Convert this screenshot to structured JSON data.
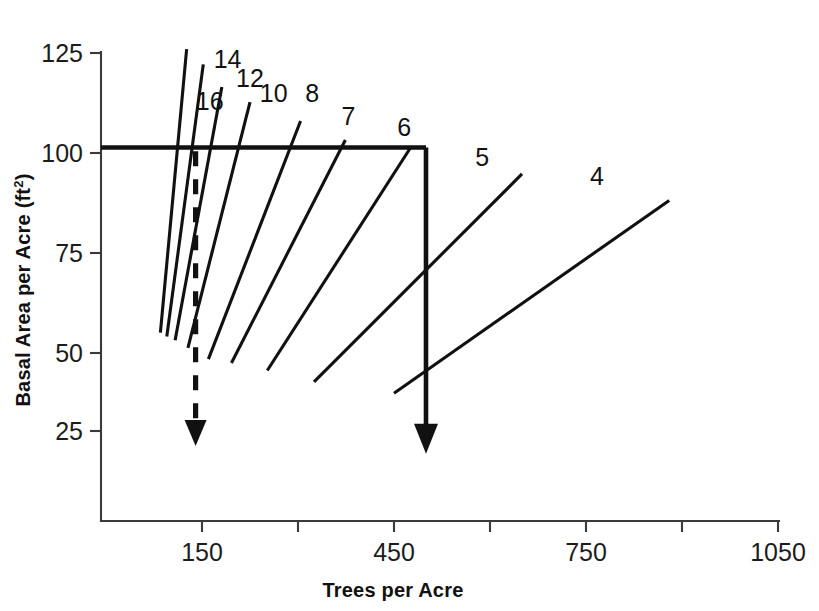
{
  "chart_data": {
    "type": "line",
    "title": "",
    "xlabel": "Trees per Acre",
    "ylabel": "Basal Area per Acre (ft",
    "ylabel_superscript": "2",
    "ylabel_suffix": ")",
    "xlim": [
      0,
      1150
    ],
    "ylim": [
      10,
      130
    ],
    "grid": false,
    "legend_position": "inline-end-labels",
    "x_ticks": [
      150,
      450,
      750,
      1050
    ],
    "x_ticks_all": [
      150,
      300,
      450,
      600,
      750,
      900,
      1050
    ],
    "x_tick_labels": [
      "150",
      "450",
      "750",
      "1050"
    ],
    "y_ticks": [
      25,
      50,
      75,
      100,
      125
    ],
    "y_tick_labels": [
      "25",
      "50",
      "75",
      "100",
      "125"
    ],
    "series": [
      {
        "name": "16",
        "label": "16",
        "label_x": 162,
        "label_y": 110,
        "points": [
          [
            126,
            126
          ],
          [
            85,
            51
          ]
        ]
      },
      {
        "name": "14",
        "label": "14",
        "label_x": 190,
        "label_y": 121,
        "points": [
          [
            152,
            122
          ],
          [
            95,
            50
          ]
        ]
      },
      {
        "name": "12",
        "label": "12",
        "label_x": 225,
        "label_y": 116,
        "points": [
          [
            181,
            116
          ],
          [
            108,
            49
          ]
        ]
      },
      {
        "name": "10",
        "label": "10",
        "label_x": 262,
        "label_y": 112,
        "points": [
          [
            225,
            112
          ],
          [
            128,
            47
          ]
        ]
      },
      {
        "name": "8",
        "label": "8",
        "label_x": 322,
        "label_y": 112,
        "points": [
          [
            304,
            107
          ],
          [
            160,
            44
          ]
        ]
      },
      {
        "name": "7",
        "label": "7",
        "label_x": 379,
        "label_y": 106,
        "points": [
          [
            374,
            102
          ],
          [
            196,
            43
          ]
        ]
      },
      {
        "name": "6",
        "label": "6",
        "label_x": 466,
        "label_y": 103,
        "points": [
          [
            476,
            100
          ],
          [
            252,
            41
          ]
        ]
      },
      {
        "name": "5",
        "label": "5",
        "label_x": 588,
        "label_y": 95,
        "points": [
          [
            650,
            93
          ],
          [
            325,
            38
          ]
        ]
      },
      {
        "name": "4",
        "label": "4",
        "label_x": 767,
        "label_y": 90,
        "points": [
          [
            880,
            86
          ],
          [
            450,
            35
          ]
        ]
      }
    ],
    "reference_line": {
      "name": "basal-area-100-reference",
      "y_value": 100,
      "x_start": 0,
      "x_end": 500,
      "style": "solid-thick"
    },
    "annotations": [
      {
        "name": "solid-arrow",
        "style": "solid",
        "x": 500,
        "y_start": 100,
        "y_end": 19,
        "direction": "down"
      },
      {
        "name": "dashed-arrow",
        "style": "dashed",
        "x": 140,
        "y_start": 99,
        "y_end": 21,
        "direction": "down"
      }
    ]
  },
  "axes": {
    "x_title": "Trees per Acre",
    "y_title_main": "Basal Area per Acre (ft",
    "y_title_sup": "2",
    "y_title_end": ")"
  }
}
